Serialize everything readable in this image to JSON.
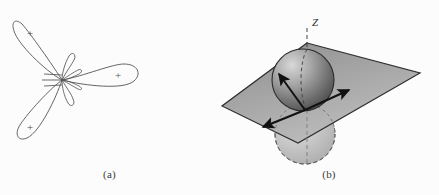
{
  "figure": {
    "background_color": "#fcfcfc",
    "ink_color": "#4a4a4a",
    "panels": [
      {
        "id": "a",
        "caption": "(a)",
        "kind": "orbital-lobe-diagram",
        "description": "Three-lobed orbital cross-section with small inner lobes",
        "origin": {
          "x": 62,
          "y": 80
        },
        "lobes": [
          {
            "name": "upper-left-lobe",
            "angle_deg": 128,
            "length": 72,
            "width": 24,
            "sign": "+",
            "label_offset": 46
          },
          {
            "name": "right-lobe",
            "angle_deg": 5,
            "length": 70,
            "width": 22,
            "sign": "+",
            "label_offset": 48
          },
          {
            "name": "lower-left-lobe",
            "angle_deg": 232,
            "length": 72,
            "width": 24,
            "sign": "+",
            "label_offset": 46
          }
        ],
        "small_lobes": [
          {
            "name": "small-lobe-upper",
            "angle_deg": 68,
            "length": 20,
            "width": 9
          },
          {
            "name": "small-lobe-lower",
            "angle_deg": 288,
            "length": 20,
            "width": 9
          },
          {
            "name": "small-lobe-inner-right",
            "angle_deg": 20,
            "length": 14,
            "width": 7
          },
          {
            "name": "small-lobe-inner-left",
            "angle_deg": 200,
            "length": 14,
            "width": 7
          }
        ],
        "hatch_lines": {
          "name": "node-hatching",
          "count": 3,
          "side": "left",
          "length": 14
        },
        "plus_label": "+"
      },
      {
        "id": "b",
        "caption": "(b)",
        "kind": "3d-plane-sphere-diagram",
        "description": "Gray parallelogram plane with shaded sphere above and dashed sphere below, vertical Z axis and three vectors",
        "axis_label": "Z",
        "plane": {
          "name": "nodal-plane",
          "fill_top": "#8a8a8a",
          "fill_bottom": "#b4b4b4",
          "stroke": "#333333",
          "points": [
            {
              "x": 88,
              "y": 43
            },
            {
              "x": 201,
              "y": 73
            },
            {
              "x": 79,
              "y": 143
            },
            {
              "x": 3,
              "y": 106
            }
          ]
        },
        "z_axis": {
          "name": "z-axis",
          "x": 88,
          "y_top": 28,
          "y_bottom": 178,
          "dashed": true,
          "color": "#555555"
        },
        "upper_sphere": {
          "name": "upper-lobe-sphere",
          "cx": 84,
          "cy": 80,
          "r": 31,
          "fill_light": "#c6c6c6",
          "fill_dark": "#5f5f5f",
          "stroke": "#2e2e2e",
          "style": "solid"
        },
        "lower_sphere": {
          "name": "lower-lobe-sphere",
          "cx": 86,
          "cy": 134,
          "r": 30,
          "fill_light": "#d2d2d2",
          "fill_dark": "#9a9a9a",
          "stroke": "#555555",
          "style": "dashed"
        },
        "vectors": [
          {
            "name": "vector-up-left",
            "x1": 86,
            "y1": 110,
            "x2": 59,
            "y2": 73
          },
          {
            "name": "vector-right",
            "x1": 86,
            "y1": 110,
            "x2": 132,
            "y2": 90
          },
          {
            "name": "vector-down-left",
            "x1": 86,
            "y1": 110,
            "x2": 42,
            "y2": 128
          }
        ]
      }
    ]
  }
}
